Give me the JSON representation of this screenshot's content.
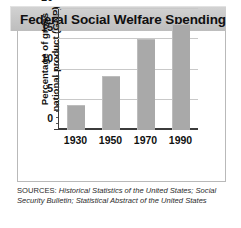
{
  "figure": {
    "title": "Federal Social Welfare Spending"
  },
  "chart_data": {
    "type": "bar",
    "title": "Federal Social Welfare Spending",
    "categories": [
      "1930",
      "1950",
      "1970",
      "1990"
    ],
    "values": [
      4.2,
      9.0,
      15.0,
      17.5
    ],
    "xlabel": "",
    "ylabel_lines": [
      "Percentage of gross",
      "national product (GNP)"
    ],
    "ylabel": "Percentage of gross national product (GNP)",
    "ylim": [
      0,
      20
    ],
    "yticks": [
      0,
      5,
      10,
      15,
      20
    ],
    "ytick_labels": [
      "0",
      "5",
      "10",
      "15",
      "20"
    ],
    "minor_tick_interval": 1,
    "grid": true,
    "grid_axis": "y",
    "legend": false,
    "bar_color": "#a9a9a9",
    "series": [
      {
        "name": "Federal social welfare spending",
        "values": [
          4.2,
          9.0,
          15.0,
          17.5
        ]
      }
    ]
  },
  "sources": {
    "lead": "SOURCES: ",
    "line1_italic": "Historical Statistics of the United States;",
    "line2_italic": "Social Security Bulletin; Statistical Abstract of the",
    "line3_italic": "United States"
  }
}
